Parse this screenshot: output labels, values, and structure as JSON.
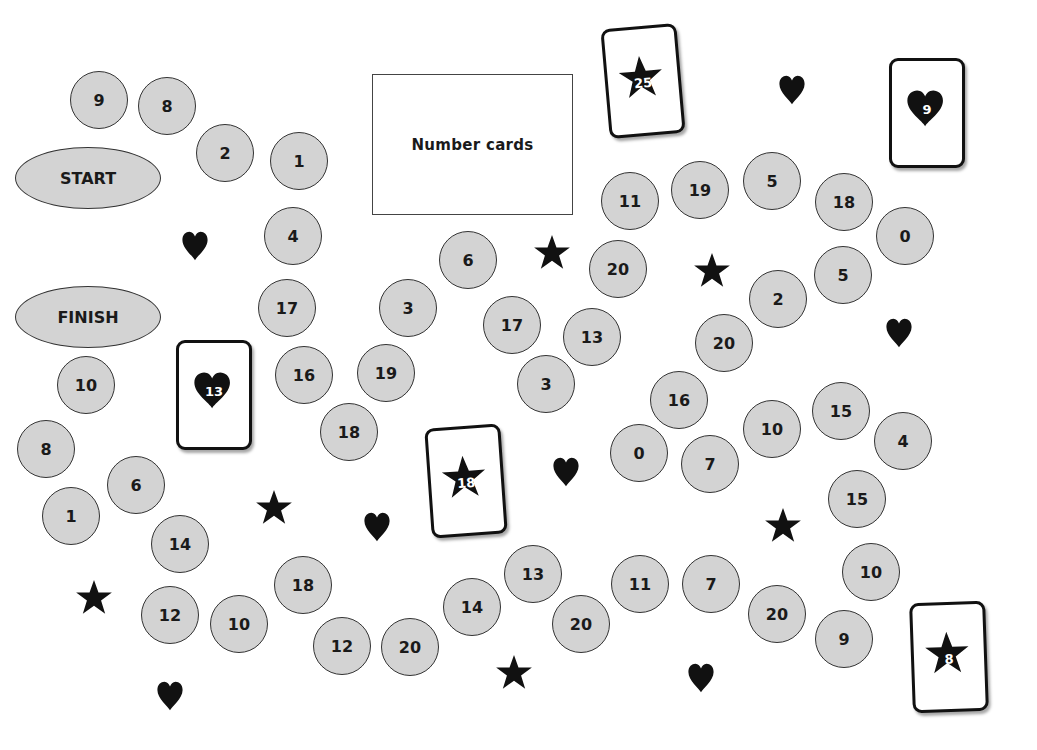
{
  "deck": {
    "label": "Number cards"
  },
  "start": {
    "label": "START",
    "x": 15,
    "y": 147
  },
  "finish": {
    "label": "FINISH",
    "x": 15,
    "y": 286
  },
  "spaces": [
    {
      "v": "9",
      "x": 70,
      "y": 71
    },
    {
      "v": "8",
      "x": 138,
      "y": 77
    },
    {
      "v": "2",
      "x": 196,
      "y": 124
    },
    {
      "v": "1",
      "x": 270,
      "y": 132
    },
    {
      "v": "4",
      "x": 264,
      "y": 207
    },
    {
      "v": "17",
      "x": 258,
      "y": 279
    },
    {
      "v": "16",
      "x": 275,
      "y": 346
    },
    {
      "v": "19",
      "x": 357,
      "y": 344
    },
    {
      "v": "18",
      "x": 320,
      "y": 403
    },
    {
      "v": "3",
      "x": 379,
      "y": 279
    },
    {
      "v": "6",
      "x": 439,
      "y": 231
    },
    {
      "v": "17",
      "x": 483,
      "y": 296
    },
    {
      "v": "3",
      "x": 517,
      "y": 355
    },
    {
      "v": "13",
      "x": 563,
      "y": 308
    },
    {
      "v": "20",
      "x": 589,
      "y": 240
    },
    {
      "v": "11",
      "x": 601,
      "y": 172
    },
    {
      "v": "19",
      "x": 671,
      "y": 161
    },
    {
      "v": "5",
      "x": 743,
      "y": 152
    },
    {
      "v": "18",
      "x": 815,
      "y": 173
    },
    {
      "v": "0",
      "x": 876,
      "y": 207
    },
    {
      "v": "5",
      "x": 814,
      "y": 246
    },
    {
      "v": "2",
      "x": 749,
      "y": 270
    },
    {
      "v": "20",
      "x": 695,
      "y": 314
    },
    {
      "v": "16",
      "x": 650,
      "y": 371
    },
    {
      "v": "0",
      "x": 610,
      "y": 424
    },
    {
      "v": "7",
      "x": 681,
      "y": 435
    },
    {
      "v": "10",
      "x": 743,
      "y": 400
    },
    {
      "v": "15",
      "x": 812,
      "y": 382
    },
    {
      "v": "4",
      "x": 874,
      "y": 412
    },
    {
      "v": "15",
      "x": 828,
      "y": 470
    },
    {
      "v": "10",
      "x": 842,
      "y": 543
    },
    {
      "v": "9",
      "x": 815,
      "y": 610
    },
    {
      "v": "20",
      "x": 748,
      "y": 585
    },
    {
      "v": "7",
      "x": 682,
      "y": 555
    },
    {
      "v": "11",
      "x": 611,
      "y": 555
    },
    {
      "v": "20",
      "x": 552,
      "y": 595
    },
    {
      "v": "13",
      "x": 504,
      "y": 545
    },
    {
      "v": "14",
      "x": 443,
      "y": 578
    },
    {
      "v": "20",
      "x": 381,
      "y": 618
    },
    {
      "v": "12",
      "x": 313,
      "y": 617
    },
    {
      "v": "18",
      "x": 274,
      "y": 556
    },
    {
      "v": "10",
      "x": 210,
      "y": 595
    },
    {
      "v": "12",
      "x": 141,
      "y": 586
    },
    {
      "v": "14",
      "x": 151,
      "y": 515
    },
    {
      "v": "6",
      "x": 107,
      "y": 456
    },
    {
      "v": "1",
      "x": 42,
      "y": 487
    },
    {
      "v": "8",
      "x": 17,
      "y": 420
    },
    {
      "v": "10",
      "x": 57,
      "y": 356
    }
  ],
  "cards": [
    {
      "suit": "star",
      "v": "25",
      "x": 605,
      "y": 26,
      "rot": -5
    },
    {
      "suit": "heart",
      "v": "9",
      "x": 889,
      "y": 58,
      "rot": 0
    },
    {
      "suit": "heart",
      "v": "13",
      "x": 176,
      "y": 340,
      "rot": 0
    },
    {
      "suit": "star",
      "v": "18",
      "x": 428,
      "y": 426,
      "rot": -4
    },
    {
      "suit": "star",
      "v": "8",
      "x": 911,
      "y": 602,
      "rot": -2
    }
  ],
  "symbols": [
    {
      "type": "heart",
      "x": 180,
      "y": 229
    },
    {
      "type": "heart",
      "x": 777,
      "y": 73
    },
    {
      "type": "star",
      "x": 533,
      "y": 233
    },
    {
      "type": "star",
      "x": 693,
      "y": 251
    },
    {
      "type": "heart",
      "x": 884,
      "y": 316
    },
    {
      "type": "heart",
      "x": 551,
      "y": 455
    },
    {
      "type": "heart",
      "x": 362,
      "y": 510
    },
    {
      "type": "star",
      "x": 255,
      "y": 488
    },
    {
      "type": "star",
      "x": 764,
      "y": 506
    },
    {
      "type": "star",
      "x": 75,
      "y": 578
    },
    {
      "type": "heart",
      "x": 155,
      "y": 679
    },
    {
      "type": "star",
      "x": 495,
      "y": 653
    },
    {
      "type": "heart",
      "x": 686,
      "y": 661
    }
  ],
  "colors": {
    "space_fill": "#d3d3d3",
    "ink": "#111111",
    "background": "#ffffff"
  }
}
